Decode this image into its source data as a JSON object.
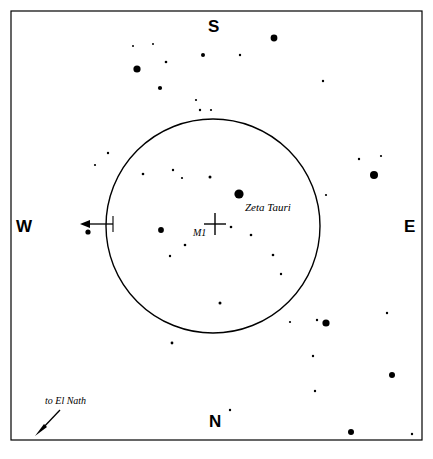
{
  "chart_data": {
    "type": "scatter",
    "title": "",
    "xlabel": "",
    "ylabel": "",
    "xlim": [
      11,
      422
    ],
    "ylim": [
      11,
      440
    ],
    "grid": false,
    "legend_position": "none",
    "frame": {
      "x": 11,
      "y": 11,
      "width": 411,
      "height": 429,
      "stroke": "#000000",
      "stroke_width": 1.2
    },
    "eyepiece_field": {
      "name": "finder-field-circle",
      "cx": 213,
      "cy": 226,
      "r": 107,
      "stroke": "#000000",
      "stroke_width": 1.4,
      "fill": "none"
    },
    "target_marker": {
      "name": "m1-cross",
      "cx": 215,
      "cy": 224,
      "arm": 11,
      "stroke_width": 1.4
    },
    "stars": [
      {
        "x": 133,
        "y": 46,
        "r": 1.0
      },
      {
        "x": 153,
        "y": 44,
        "r": 1.0
      },
      {
        "x": 137,
        "y": 69,
        "r": 3.6
      },
      {
        "x": 166,
        "y": 62,
        "r": 1.3
      },
      {
        "x": 203,
        "y": 55,
        "r": 2.0
      },
      {
        "x": 160,
        "y": 88,
        "r": 2.1
      },
      {
        "x": 196,
        "y": 100,
        "r": 1.1
      },
      {
        "x": 200,
        "y": 110,
        "r": 1.2
      },
      {
        "x": 211,
        "y": 110,
        "r": 1.1
      },
      {
        "x": 274,
        "y": 38,
        "r": 3.4
      },
      {
        "x": 240,
        "y": 55,
        "r": 1.2
      },
      {
        "x": 323,
        "y": 81,
        "r": 1.2
      },
      {
        "x": 359,
        "y": 159,
        "r": 1.2
      },
      {
        "x": 381,
        "y": 156,
        "r": 1.1
      },
      {
        "x": 374,
        "y": 175,
        "r": 4.0
      },
      {
        "x": 108,
        "y": 153,
        "r": 1.2
      },
      {
        "x": 95,
        "y": 165,
        "r": 1.1
      },
      {
        "x": 326,
        "y": 195,
        "r": 1.1
      },
      {
        "x": 88,
        "y": 232,
        "r": 2.6
      },
      {
        "x": 143,
        "y": 174,
        "r": 1.3
      },
      {
        "x": 173,
        "y": 170,
        "r": 1.2
      },
      {
        "x": 182,
        "y": 178,
        "r": 1.1
      },
      {
        "x": 210,
        "y": 177,
        "r": 1.5
      },
      {
        "x": 239,
        "y": 194,
        "r": 4.6
      },
      {
        "x": 161,
        "y": 230,
        "r": 2.9
      },
      {
        "x": 231,
        "y": 227,
        "r": 1.3
      },
      {
        "x": 251,
        "y": 235,
        "r": 1.3
      },
      {
        "x": 185,
        "y": 245,
        "r": 1.3
      },
      {
        "x": 170,
        "y": 256,
        "r": 1.2
      },
      {
        "x": 273,
        "y": 255,
        "r": 1.3
      },
      {
        "x": 281,
        "y": 274,
        "r": 1.2
      },
      {
        "x": 220,
        "y": 303,
        "r": 1.5
      },
      {
        "x": 172,
        "y": 343,
        "r": 1.4
      },
      {
        "x": 317,
        "y": 320,
        "r": 1.2
      },
      {
        "x": 326,
        "y": 323,
        "r": 3.6
      },
      {
        "x": 387,
        "y": 313,
        "r": 1.2
      },
      {
        "x": 313,
        "y": 356,
        "r": 1.2
      },
      {
        "x": 392,
        "y": 375,
        "r": 3.0
      },
      {
        "x": 315,
        "y": 391,
        "r": 1.2
      },
      {
        "x": 230,
        "y": 410,
        "r": 1.2
      },
      {
        "x": 351,
        "y": 432,
        "r": 3.0
      },
      {
        "x": 412,
        "y": 434,
        "r": 1.2
      },
      {
        "x": 290,
        "y": 322,
        "r": 1.1
      }
    ],
    "annotations": [
      {
        "name": "west-direction-arrow",
        "type": "arrow",
        "from": {
          "x": 113,
          "y": 224
        },
        "to": {
          "x": 82,
          "y": 224
        },
        "head": "to"
      },
      {
        "name": "el-nath-arrow",
        "type": "arrow",
        "from": {
          "x": 60,
          "y": 410
        },
        "to": {
          "x": 36,
          "y": 435
        },
        "head": "to"
      }
    ]
  },
  "cardinals": {
    "south": "S",
    "north": "N",
    "west": "W",
    "east": "E"
  },
  "labels": {
    "zeta_tauri": "Zeta Tauri",
    "m1": "M1",
    "el_nath": "to El Nath"
  },
  "colors": {
    "ink": "#000000",
    "background": "#ffffff"
  }
}
